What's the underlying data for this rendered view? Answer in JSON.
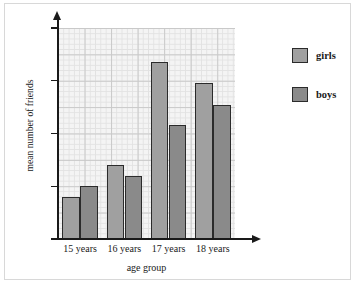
{
  "chart_data": {
    "type": "bar",
    "title": "",
    "xlabel": "age group",
    "ylabel": "mean number of friends",
    "categories": [
      "15 years",
      "16 years",
      "17 years",
      "18 years"
    ],
    "series": [
      {
        "name": "girls",
        "color": "#a0a0a0",
        "values": [
          40,
          70,
          168,
          148
        ]
      },
      {
        "name": "boys",
        "color": "#8a8a8a",
        "values": [
          50,
          60,
          108,
          127
        ]
      }
    ],
    "ylim": [
      0,
      200
    ],
    "y_ticks": [
      0,
      50,
      100,
      150,
      200
    ],
    "y_tick_labels": [
      "0",
      "50",
      "100",
      "150",
      "200"
    ],
    "grid": true,
    "grid_major_step": 25,
    "grid_minor_step": 5,
    "legend_position": "right",
    "legend_entries": [
      "girls",
      "boys"
    ]
  },
  "axis": {
    "y_title": "mean number of friends",
    "x_title": "age group",
    "y_labels": [
      "200",
      "150",
      "100",
      "50",
      "0"
    ]
  },
  "legend": {
    "items": [
      {
        "label": "girls",
        "swatch": "girls-swatch"
      },
      {
        "label": "boys",
        "swatch": "boys-swatch"
      }
    ]
  }
}
